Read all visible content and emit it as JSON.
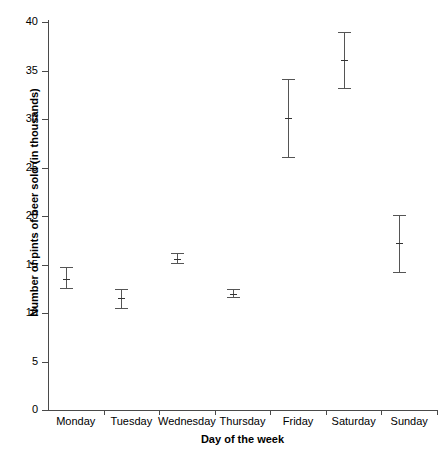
{
  "chart_data": {
    "type": "scatter",
    "title": "",
    "xlabel": "Day of the week",
    "ylabel": "Number of pints of beer sold (in thousands)",
    "categories": [
      "Monday",
      "Tuesday",
      "Wednesday",
      "Thursday",
      "Friday",
      "Saturday",
      "Sunday"
    ],
    "values": [
      13.5,
      11.5,
      15.6,
      12.0,
      30.1,
      36.1,
      17.2
    ],
    "error_low": [
      12.6,
      10.5,
      15.2,
      11.6,
      26.1,
      33.2,
      14.2
    ],
    "error_high": [
      14.7,
      12.5,
      16.2,
      12.5,
      34.1,
      39.0,
      20.1
    ],
    "ylim": [
      0,
      40
    ],
    "yticks": [
      0,
      5,
      10,
      15,
      20,
      25,
      30,
      35,
      40
    ],
    "ytick_labels": [
      "0",
      "5",
      "10",
      "15",
      "20",
      "25",
      "30",
      "35",
      "40"
    ],
    "grid": false,
    "legend": "none",
    "marker": "mean-with-error-bars",
    "series": [
      {
        "name": "Pints of beer sold",
        "points": [
          {
            "category": "Monday",
            "value": 13.5,
            "low": 12.6,
            "high": 14.7
          },
          {
            "category": "Tuesday",
            "value": 11.5,
            "low": 10.5,
            "high": 12.5
          },
          {
            "category": "Wednesday",
            "value": 15.6,
            "low": 15.2,
            "high": 16.2
          },
          {
            "category": "Thursday",
            "value": 12.0,
            "low": 11.6,
            "high": 12.5
          },
          {
            "category": "Friday",
            "value": 30.1,
            "low": 26.1,
            "high": 34.1
          },
          {
            "category": "Saturday",
            "value": 36.1,
            "low": 33.2,
            "high": 39.0
          },
          {
            "category": "Sunday",
            "value": 17.2,
            "low": 14.2,
            "high": 20.1
          }
        ]
      }
    ]
  },
  "axis": {
    "y_title": "Number of pints of beer sold (in thousands)",
    "x_title": "Day of the week"
  },
  "colors": {
    "background": "#ffffff",
    "axis": "#4a4a4a",
    "marker": "#555555",
    "text": "#000000"
  }
}
